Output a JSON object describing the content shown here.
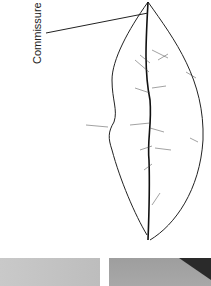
{
  "figure": {
    "label": "Commissure"
  },
  "photos": [
    {
      "name": "photo-left",
      "tone": "#c4c4c4"
    },
    {
      "name": "photo-right",
      "tone": "#a3a3a3"
    }
  ]
}
